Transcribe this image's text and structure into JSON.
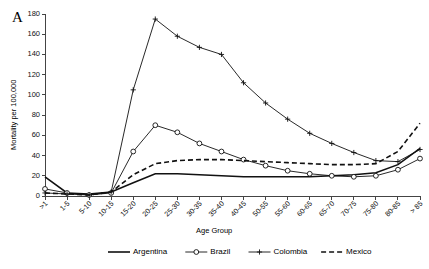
{
  "panel": {
    "label": "A"
  },
  "axes": {
    "ylabel": "Mortality per 100,000",
    "xlabel": "Age Group",
    "yticks": [
      "0",
      "20",
      "40",
      "60",
      "80",
      "100",
      "120",
      "140",
      "160",
      "180"
    ]
  },
  "legend": {
    "items": [
      {
        "label": "Argentina",
        "style": "solid-line"
      },
      {
        "label": "Brazil",
        "style": "circle-marker-line"
      },
      {
        "label": "Colombia",
        "style": "plus-marker-line"
      },
      {
        "label": "Mexico",
        "style": "dashed-line"
      }
    ]
  },
  "chart_data": {
    "type": "line",
    "title": "A",
    "xlabel": "Age Group",
    "ylabel": "Mortality per 100,000",
    "ylim": [
      0,
      180
    ],
    "ytick_step": 20,
    "grid": false,
    "legend_position": "bottom",
    "categories": [
      ">1",
      "1-5",
      "5-10",
      "10-15",
      "15-20",
      "20-25",
      "25-30",
      "30-35",
      "35-40",
      "40-45",
      "50-55",
      "55-60",
      "60-65",
      "65-70",
      "70-75",
      "75-80",
      "80-85",
      "> 85"
    ],
    "series": [
      {
        "name": "Argentina",
        "marker": "none",
        "dash": "none",
        "values": [
          19,
          3,
          2,
          4,
          13,
          22,
          22,
          21,
          20,
          19,
          19,
          19,
          19,
          20,
          21,
          23,
          31,
          47
        ]
      },
      {
        "name": "Brazil",
        "marker": "circle",
        "dash": "none",
        "values": [
          7,
          3,
          1,
          3,
          44,
          70,
          63,
          52,
          44,
          36,
          30,
          25,
          22,
          20,
          19,
          20,
          26,
          37
        ]
      },
      {
        "name": "Colombia",
        "marker": "plus",
        "dash": "none",
        "values": [
          3,
          2,
          1,
          4,
          105,
          175,
          158,
          147,
          140,
          112,
          92,
          76,
          62,
          52,
          43,
          35,
          34,
          46
        ]
      },
      {
        "name": "Mexico",
        "marker": "none",
        "dash": "dashed",
        "values": [
          3,
          2,
          1,
          4,
          21,
          32,
          35,
          36,
          36,
          35,
          34,
          33,
          32,
          31,
          31,
          32,
          44,
          72
        ]
      }
    ]
  }
}
